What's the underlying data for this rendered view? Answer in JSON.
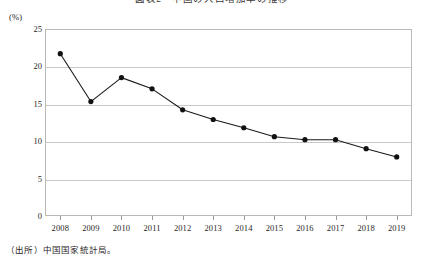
{
  "title": "図表2　中国の人口増加率の推移",
  "source_note": "（出所）中国国家統計局。",
  "y_unit_label": "(%)",
  "chart_data": {
    "type": "line",
    "title": "図表2　中国の人口増加率の推移",
    "xlabel": "",
    "ylabel": "(%)",
    "ylim": [
      0,
      25
    ],
    "ytick_labels": [
      "0",
      "5",
      "10",
      "15",
      "20",
      "25"
    ],
    "ytick_values": [
      0,
      5,
      10,
      15,
      20,
      25
    ],
    "grid": true,
    "legend": "none",
    "marker": "filled-circle",
    "line_color": "#1a1a1a",
    "marker_color": "#111111",
    "categories": [
      "2008",
      "2009",
      "2010",
      "2011",
      "2012",
      "2013",
      "2014",
      "2015",
      "2016",
      "2017",
      "2018",
      "2019"
    ],
    "values": [
      21.7,
      15.3,
      18.5,
      17.0,
      14.2,
      12.9,
      11.8,
      10.6,
      10.2,
      10.2,
      9.0,
      7.9
    ],
    "series": [
      {
        "name": "比率",
        "values": [
          21.7,
          15.3,
          18.5,
          17.0,
          14.2,
          12.9,
          11.8,
          10.6,
          10.2,
          10.2,
          9.0,
          7.9
        ]
      }
    ]
  }
}
